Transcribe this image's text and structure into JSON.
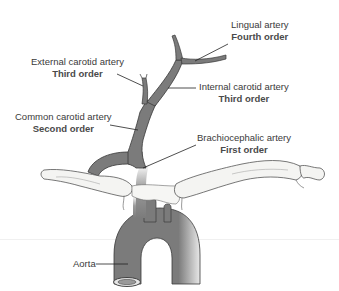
{
  "diagram": {
    "colors": {
      "vessel_fill": "#7b7b7b",
      "vessel_stroke": "#3a3a3a",
      "bone_fill": "#f4f4f2",
      "bone_stroke": "#555555",
      "leader_line": "#222222",
      "text": "#3a3a3a"
    },
    "labels": [
      {
        "id": "lingual",
        "name": "Lingual artery",
        "order": "Fourth order"
      },
      {
        "id": "external",
        "name": "External carotid artery",
        "order": "Third order"
      },
      {
        "id": "internal",
        "name": "Internal carotid artery",
        "order": "Third order"
      },
      {
        "id": "common",
        "name": "Common carotid artery",
        "order": "Second order"
      },
      {
        "id": "brachio",
        "name": "Brachiocephalic artery",
        "order": "First order"
      },
      {
        "id": "aorta",
        "name": "Aorta",
        "order": ""
      }
    ]
  }
}
